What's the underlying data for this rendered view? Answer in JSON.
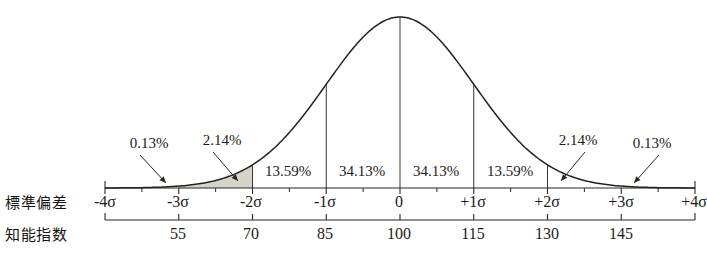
{
  "labels": {
    "sigma_row": "標準偏差",
    "iq_row": "知能指数"
  },
  "colors": {
    "ink": "#1d1b18",
    "curve": "#24211c",
    "shade": "#d6d4c9",
    "background": "#ffffff"
  },
  "chart_data": {
    "type": "line",
    "title": "",
    "subtitle": "",
    "xlabel": "標準偏差",
    "ylabel": "",
    "distribution": "normal",
    "mean": 100,
    "std_dev": 15,
    "grid": false,
    "legend": false,
    "xlim": [
      -4,
      4
    ],
    "sigma_ticks": [
      {
        "sigma": -4,
        "label": "-4σ",
        "iq": null,
        "iq_label": ""
      },
      {
        "sigma": -3,
        "label": "-3σ",
        "iq": 55,
        "iq_label": "55"
      },
      {
        "sigma": -2,
        "label": "-2σ",
        "iq": 70,
        "iq_label": "70"
      },
      {
        "sigma": -1,
        "label": "-1σ",
        "iq": 85,
        "iq_label": "85"
      },
      {
        "sigma": 0,
        "label": "0",
        "iq": 100,
        "iq_label": "100"
      },
      {
        "sigma": 1,
        "label": "+1σ",
        "iq": 115,
        "iq_label": "115"
      },
      {
        "sigma": 2,
        "label": "+2σ",
        "iq": 130,
        "iq_label": "130"
      },
      {
        "sigma": 3,
        "label": "+3σ",
        "iq": 145,
        "iq_label": "145"
      },
      {
        "sigma": 4,
        "label": "+4σ",
        "iq": null,
        "iq_label": ""
      }
    ],
    "bands": [
      {
        "from": -4,
        "to": -3,
        "label": "0.13%",
        "value": 0.13,
        "callout": true
      },
      {
        "from": -3,
        "to": -2,
        "label": "2.14%",
        "value": 2.14,
        "callout": true,
        "shaded": true
      },
      {
        "from": -2,
        "to": -1,
        "label": "13.59%",
        "value": 13.59,
        "callout": false
      },
      {
        "from": -1,
        "to": 0,
        "label": "34.13%",
        "value": 34.13,
        "callout": false
      },
      {
        "from": 0,
        "to": 1,
        "label": "34.13%",
        "value": 34.13,
        "callout": false
      },
      {
        "from": 1,
        "to": 2,
        "label": "13.59%",
        "value": 13.59,
        "callout": false
      },
      {
        "from": 2,
        "to": 3,
        "label": "2.14%",
        "value": 2.14,
        "callout": true
      },
      {
        "from": 3,
        "to": 4,
        "label": "0.13%",
        "value": 0.13,
        "callout": true
      }
    ],
    "band_labels": {
      "left_013": "0.13%",
      "left_214": "2.14%",
      "left_1359": "13.59%",
      "left_3413": "34.13%",
      "right_3413": "34.13%",
      "right_1359": "13.59%",
      "right_214": "2.14%",
      "right_013": "0.13%"
    },
    "sigma_tick_labels": {
      "m4": "-4σ",
      "m3": "-3σ",
      "m2": "-2σ",
      "m1": "-1σ",
      "z0": "0",
      "p1": "+1σ",
      "p2": "+2σ",
      "p3": "+3σ",
      "p4": "+4σ"
    },
    "iq_tick_labels": {
      "v55": "55",
      "v70": "70",
      "v85": "85",
      "v100": "100",
      "v115": "115",
      "v130": "130",
      "v145": "145"
    }
  }
}
